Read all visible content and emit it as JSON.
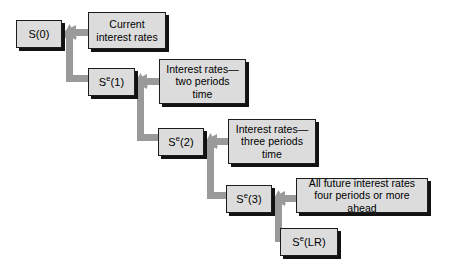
{
  "diagram": {
    "colors": {
      "box_fill": "#dcdcdc",
      "box_border": "#1c1c1c",
      "box_shadow": "#121212",
      "connector": "#9a9a9a",
      "background": "#ffffff",
      "text": "#000000"
    },
    "nodes": [
      {
        "id": "s0",
        "kind": "state",
        "label": "S(0)",
        "base": "S",
        "superscript": "",
        "argument": "(0)",
        "x": 16,
        "y": 20,
        "w": 46,
        "h": 28
      },
      {
        "id": "current-rates",
        "kind": "descr",
        "label": "Current\ninterest rates",
        "lines": [
          "Current",
          "interest rates"
        ],
        "x": 88,
        "y": 12,
        "w": 78,
        "h": 37
      },
      {
        "id": "se1",
        "kind": "state",
        "label": "Se(1)",
        "base": "S",
        "superscript": "e",
        "argument": "(1)",
        "x": 88,
        "y": 68,
        "w": 47,
        "h": 28
      },
      {
        "id": "rates-two-periods",
        "kind": "descr",
        "label": "Interest rates—\ntwo periods\ntime",
        "lines": [
          "Interest rates—",
          "two periods",
          "time"
        ],
        "x": 159,
        "y": 59,
        "w": 87,
        "h": 45
      },
      {
        "id": "se2",
        "kind": "state",
        "label": "Se(2)",
        "base": "S",
        "superscript": "e",
        "argument": "(2)",
        "x": 158,
        "y": 128,
        "w": 46,
        "h": 28
      },
      {
        "id": "rates-three-periods",
        "kind": "descr",
        "label": "Interest rates—\nthree periods\ntime",
        "lines": [
          "Interest rates—",
          "three periods",
          "time"
        ],
        "x": 228,
        "y": 119,
        "w": 88,
        "h": 45
      },
      {
        "id": "se3",
        "kind": "state",
        "label": "Se(3)",
        "base": "S",
        "superscript": "e",
        "argument": "(3)",
        "x": 226,
        "y": 185,
        "w": 46,
        "h": 28
      },
      {
        "id": "all-future-rates",
        "kind": "descr",
        "label": "All future interest rates\nfour periods or more ahead",
        "lines": [
          "All future interest rates",
          "four periods or more ahead"
        ],
        "x": 296,
        "y": 178,
        "w": 132,
        "h": 35
      },
      {
        "id": "selr",
        "kind": "state",
        "label": "Se(LR)",
        "base": "S",
        "superscript": "e",
        "argument": "(LR)",
        "x": 280,
        "y": 228,
        "w": 58,
        "h": 28
      }
    ],
    "connectors": [
      {
        "id": "current-to-s0",
        "from": "current-rates",
        "to": "s0",
        "direction": "left",
        "description": "horizontal arrow from Current interest rates into S(0)"
      },
      {
        "id": "se1-to-current",
        "from": "se1",
        "to": "current-rates",
        "direction": "up",
        "description": "vertical arrow rising from Se(1) level into the Current interest rates junction"
      },
      {
        "id": "two-periods-to-se1",
        "from": "rates-two-periods",
        "to": "se1",
        "direction": "left",
        "description": "horizontal arrow from Interest rates two periods time into Se(1)"
      },
      {
        "id": "se2-to-two-periods",
        "from": "se2",
        "to": "rates-two-periods",
        "direction": "up",
        "description": "vertical arrow rising from Se(2) level into the two-periods junction"
      },
      {
        "id": "three-periods-to-se2",
        "from": "rates-three-periods",
        "to": "se2",
        "direction": "left",
        "description": "horizontal arrow from Interest rates three periods time into Se(2)"
      },
      {
        "id": "se3-to-three-periods",
        "from": "se3",
        "to": "rates-three-periods",
        "direction": "up",
        "description": "vertical arrow rising from Se(3) level into the three-periods junction"
      },
      {
        "id": "all-future-to-se3",
        "from": "all-future-rates",
        "to": "se3",
        "direction": "left",
        "description": "horizontal arrow from All future interest rates into Se(3)"
      },
      {
        "id": "selr-to-all-future",
        "from": "selr",
        "to": "all-future-rates",
        "direction": "up",
        "description": "vertical arrow rising from Se(LR) into the all-future-rates junction"
      }
    ]
  }
}
